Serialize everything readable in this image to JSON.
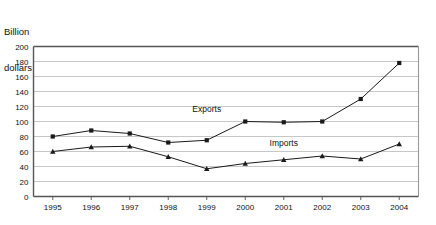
{
  "chart_data": {
    "type": "line",
    "title": "Billion dollars",
    "title_line1": "Billion",
    "title_line2": "dollars",
    "xlabel": "",
    "ylabel": "Billion dollars",
    "ylim": [
      0,
      200
    ],
    "ytick_step": 20,
    "grid": true,
    "legend_position": "inline-annotations",
    "categories": [
      "1995",
      "1996",
      "1997",
      "1998",
      "1999",
      "2000",
      "2001",
      "2002",
      "2003",
      "2004"
    ],
    "yticks": [
      "0",
      "20",
      "40",
      "60",
      "80",
      "100",
      "120",
      "140",
      "160",
      "180",
      "200"
    ],
    "series": [
      {
        "name": "Exports",
        "marker": "square",
        "color": "#1a1a1a",
        "values": [
          80,
          88,
          84,
          72,
          75,
          100,
          99,
          100,
          130,
          178
        ]
      },
      {
        "name": "Imports",
        "marker": "triangle",
        "color": "#1a1a1a",
        "values": [
          60,
          66,
          67,
          53,
          37,
          44,
          49,
          54,
          50,
          70
        ]
      }
    ],
    "annotations": [
      {
        "text": "Exports",
        "x_value": "1999",
        "y_value": 113
      },
      {
        "text": "Imports",
        "x_value": "2001",
        "y_value": 68
      }
    ]
  }
}
